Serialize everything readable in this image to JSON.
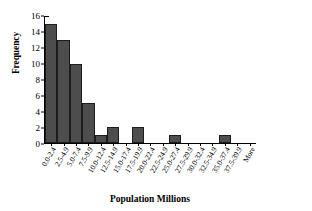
{
  "chart_data": {
    "type": "bar",
    "title": "",
    "xlabel": "Population Millions",
    "ylabel": "Frequency",
    "ylim": [
      0,
      16
    ],
    "yticks": [
      0,
      2,
      4,
      6,
      8,
      10,
      12,
      14,
      16
    ],
    "grid": false,
    "legend": null,
    "bar_color": "#4d4d4d",
    "bar_edge_color": "#1c1c1c",
    "categories": [
      "0.0-2.4",
      "2.5-4.9",
      "5.0-7.4",
      "7.5-9.9",
      "10.0-12.4",
      "12.5-14.9",
      "15.0-17.4",
      "17.5-19.9",
      "20.0-22.4",
      "22.5-24.9",
      "25.0-27.4",
      "27.5-29.9",
      "30.0-32.4",
      "32.5-34.9",
      "35.0-37.4",
      "37.5-39.9",
      "More"
    ],
    "values": [
      15,
      13,
      10,
      5,
      1,
      2,
      0,
      2,
      0,
      0,
      1,
      0,
      0,
      0,
      1,
      0,
      0
    ]
  }
}
